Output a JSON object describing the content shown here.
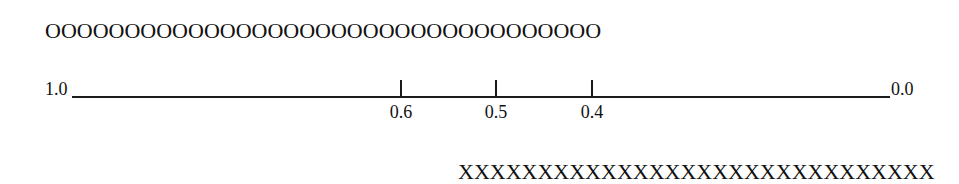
{
  "top_row": {
    "symbol": "O",
    "count": 35,
    "text": "OOOOOOOOOOOOOOOOOOOOOOOOOOOOOOOOOOO"
  },
  "bottom_row": {
    "symbol": "X",
    "count": 30,
    "text": "XXXXXXXXXXXXXXXXXXXXXXXXXXXXXX"
  },
  "scale": {
    "left_label": "1.0",
    "right_label": "0.0",
    "ticks": [
      {
        "value": "0.6",
        "x": 401
      },
      {
        "value": "0.5",
        "x": 496
      },
      {
        "value": "0.4",
        "x": 592
      }
    ]
  }
}
